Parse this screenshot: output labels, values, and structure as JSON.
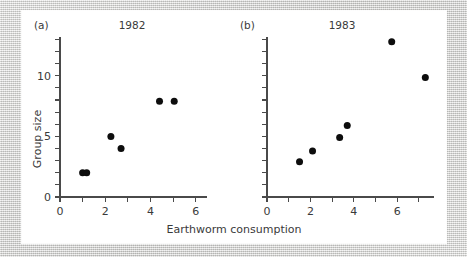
{
  "figure": {
    "x_axis_label": "Earthworm consumption",
    "y_axis_label": "Group size",
    "panel_a_tag": "(a)",
    "panel_b_tag": "(b)",
    "panel_a_title": "1982",
    "panel_b_title": "1983",
    "point_color": "#0d0d0d",
    "axis_color": "#4a4a4a",
    "card_color": "#ffffff",
    "background_color": "#dcdcda"
  },
  "chart_data": [
    {
      "type": "scatter",
      "title": "1982",
      "panel": "(a)",
      "xlabel": "Earthworm consumption",
      "ylabel": "Group size",
      "xlim": [
        0,
        6.5
      ],
      "ylim": [
        0,
        13.2
      ],
      "x_ticks": [
        0,
        1,
        2,
        3,
        4,
        5,
        6
      ],
      "x_tick_labels": [
        "0",
        "",
        "2",
        "",
        "4",
        "",
        "6"
      ],
      "y_ticks": [
        0,
        1,
        2,
        3,
        4,
        5,
        6,
        7,
        8,
        9,
        10,
        11,
        12,
        13
      ],
      "y_tick_labels": [
        "0",
        "",
        "",
        "",
        "",
        "5",
        "",
        "",
        "",
        "",
        "10",
        "",
        "",
        ""
      ],
      "grid": false,
      "legend": "none",
      "points": [
        {
          "x": 1.0,
          "y": 2.0
        },
        {
          "x": 1.18,
          "y": 2.0
        },
        {
          "x": 2.25,
          "y": 5.0
        },
        {
          "x": 2.7,
          "y": 4.0
        },
        {
          "x": 4.4,
          "y": 7.9
        },
        {
          "x": 5.05,
          "y": 7.9
        }
      ]
    },
    {
      "type": "scatter",
      "title": "1983",
      "panel": "(b)",
      "xlabel": "Earthworm consumption",
      "ylabel": "Group size",
      "xlim": [
        0,
        7.7
      ],
      "ylim": [
        0,
        13.2
      ],
      "x_ticks": [
        0,
        1,
        2,
        3,
        4,
        5,
        6,
        7
      ],
      "x_tick_labels": [
        "0",
        "",
        "2",
        "",
        "4",
        "",
        "6",
        ""
      ],
      "y_ticks": [
        0,
        1,
        2,
        3,
        4,
        5,
        6,
        7,
        8,
        9,
        10,
        11,
        12,
        13
      ],
      "y_tick_labels": [
        "",
        "",
        "",
        "",
        "",
        "",
        "",
        "",
        "",
        "",
        "",
        "",
        "",
        ""
      ],
      "grid": false,
      "legend": "none",
      "points": [
        {
          "x": 1.5,
          "y": 2.9
        },
        {
          "x": 2.1,
          "y": 3.8
        },
        {
          "x": 3.35,
          "y": 4.9
        },
        {
          "x": 3.7,
          "y": 5.9
        },
        {
          "x": 5.75,
          "y": 12.8
        },
        {
          "x": 7.3,
          "y": 9.85
        }
      ]
    }
  ]
}
